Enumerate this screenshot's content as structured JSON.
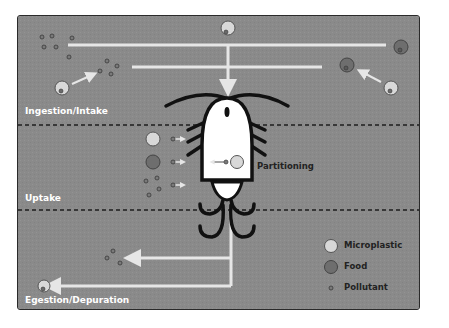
{
  "diagram": {
    "zones": [
      {
        "id": "ingestion",
        "label": "Ingestion/Intake"
      },
      {
        "id": "uptake",
        "label": "Uptake"
      },
      {
        "id": "egestion",
        "label": "Egestion/Depuration"
      }
    ],
    "annotations": {
      "partitioning": "Partitioning"
    },
    "legend": [
      {
        "label": "Microplastic",
        "color": "#d8d8d8",
        "shape": "large-circle"
      },
      {
        "label": "Food",
        "color": "#6e6e6e",
        "shape": "large-circle"
      },
      {
        "label": "Pollutant",
        "color": "#7a7a7a",
        "shape": "small-circle"
      }
    ],
    "colors": {
      "background": "#8a8a8a",
      "arrow": "#e6e6e6",
      "organism_body": "#ffffff",
      "organism_outline": "#111111",
      "divider": "#1e1e1e"
    }
  }
}
